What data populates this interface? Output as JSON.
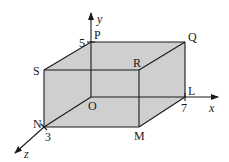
{
  "figure": {
    "fill_color": "#cfcfcf",
    "stroke_color": "#1a1a1a",
    "axes": {
      "x": {
        "label": "x",
        "tick_value": "7"
      },
      "y": {
        "label": "y",
        "tick_value": "5"
      },
      "z": {
        "label": "z",
        "tick_value": "3"
      }
    },
    "vertices": {
      "O": "O",
      "L": "L",
      "M": "M",
      "N": "N",
      "P": "P",
      "Q": "Q",
      "R": "R",
      "S": "S"
    },
    "dimensions": {
      "length_x": 7,
      "height_y": 5,
      "depth_z": 3
    }
  }
}
